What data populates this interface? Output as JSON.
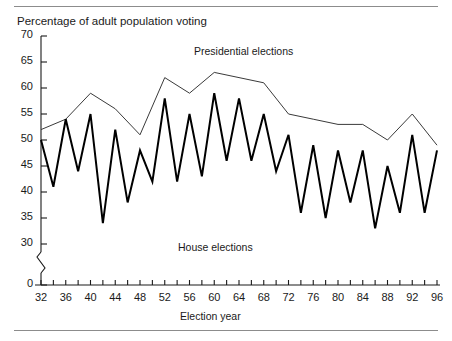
{
  "chart_data": {
    "type": "line",
    "title": "Percentage of adult population voting",
    "xlabel": "Election year",
    "ylabel": "Percentage of adult population voting",
    "xlim": [
      32,
      96
    ],
    "ylim": [
      0,
      70
    ],
    "y_axis_break": {
      "below": 30,
      "above": 0
    },
    "grid": false,
    "legend_position": "inline-annotations",
    "x_ticks": [
      32,
      34,
      36,
      38,
      40,
      42,
      44,
      46,
      48,
      50,
      52,
      54,
      56,
      58,
      60,
      62,
      64,
      66,
      68,
      70,
      72,
      74,
      76,
      78,
      80,
      82,
      84,
      86,
      88,
      90,
      92,
      94,
      96
    ],
    "x_tick_labels": [
      "32",
      "",
      "36",
      "",
      "40",
      "",
      "44",
      "",
      "48",
      "",
      "52",
      "",
      "56",
      "",
      "60",
      "",
      "64",
      "",
      "68",
      "",
      "72",
      "",
      "76",
      "",
      "80",
      "",
      "84",
      "",
      "88",
      "",
      "92",
      "",
      "96"
    ],
    "y_ticks": [
      0,
      30,
      35,
      40,
      45,
      50,
      55,
      60,
      65,
      70
    ],
    "y_tick_labels": [
      "0",
      "30",
      "35",
      "40",
      "45",
      "50",
      "55",
      "60",
      "65",
      "70"
    ],
    "series": [
      {
        "name": "Presidential elections",
        "color": "#3a3a3a",
        "line_width": 1,
        "x": [
          32,
          36,
          40,
          44,
          48,
          52,
          56,
          60,
          64,
          68,
          72,
          76,
          80,
          84,
          88,
          92,
          96
        ],
        "values": [
          52,
          54,
          59,
          56,
          51,
          62,
          59,
          63,
          62,
          61,
          55,
          54,
          53,
          53,
          50,
          55,
          49
        ]
      },
      {
        "name": "House elections",
        "color": "#000000",
        "line_width": 2,
        "x": [
          32,
          34,
          36,
          38,
          40,
          42,
          44,
          46,
          48,
          50,
          52,
          54,
          56,
          58,
          60,
          62,
          64,
          66,
          68,
          70,
          72,
          74,
          76,
          78,
          80,
          82,
          84,
          86,
          88,
          90,
          92,
          94,
          96
        ],
        "values": [
          50,
          41,
          54,
          44,
          55,
          34,
          52,
          38,
          48,
          42,
          58,
          42,
          55,
          43,
          59,
          46,
          58,
          46,
          55,
          44,
          51,
          36,
          49,
          35,
          48,
          38,
          48,
          33,
          45,
          36,
          51,
          36,
          48
        ]
      }
    ],
    "annotations": [
      {
        "text": "Presidential elections",
        "x": 57,
        "y": 66
      },
      {
        "text": "House elections",
        "x": 54,
        "y": 28
      }
    ]
  },
  "axis": {
    "x_title": "Election year",
    "y_title": "Percentage of adult population voting"
  }
}
